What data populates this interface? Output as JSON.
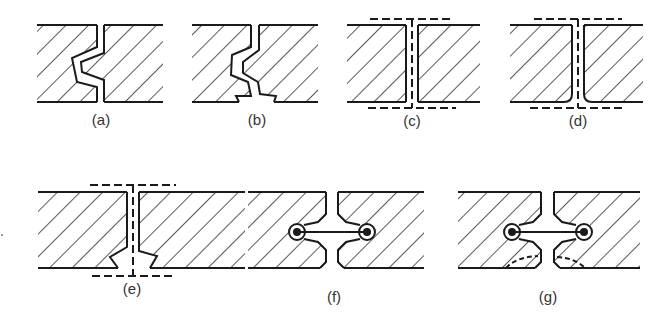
{
  "figure": {
    "stroke_color": "#1a1a1a",
    "hatch_color": "#222222",
    "panels": [
      {
        "id": "a",
        "label": "(a)",
        "type": "tongue-and-groove joint, V-shaped interlock"
      },
      {
        "id": "b",
        "label": "(b)",
        "type": "tongue-and-groove joint with lower recess"
      },
      {
        "id": "c",
        "label": "(c)",
        "type": "butt joint with dashed seal/cover strips top and bottom"
      },
      {
        "id": "d",
        "label": "(d)",
        "type": "butt joint, rounded bottom edges, dashed seal/cover strips"
      },
      {
        "id": "e",
        "label": "(e)",
        "type": "butt joint with dovetail bottom groove, dashed seal/cover strips"
      },
      {
        "id": "f",
        "label": "(f)",
        "type": "dog-bone / dumbbell connector joint"
      },
      {
        "id": "g",
        "label": "(g)",
        "type": "dog-bone connector joint with dashed fracture lines at lower corners"
      }
    ]
  }
}
